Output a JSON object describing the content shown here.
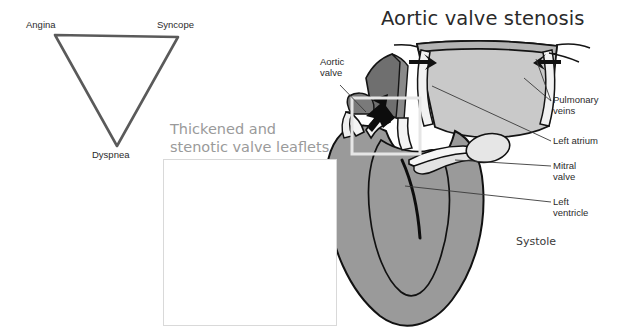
{
  "figure": {
    "title": "Aortic valve stenosis",
    "background_color": "#ffffff",
    "phase_label": "Systole"
  },
  "symptom_triad": {
    "shape": "inverted-triangle",
    "stroke_color": "#5a5a5a",
    "vertices": [
      {
        "label": "Angina",
        "x": 55,
        "y": 35
      },
      {
        "label": "Syncope",
        "x": 178,
        "y": 37
      },
      {
        "label": "Dyspnea",
        "x": 117,
        "y": 146
      }
    ]
  },
  "inset": {
    "caption_line1": "Thickened and",
    "caption_line2": "stenotic valve leaflets",
    "caption_color": "#9a9a9a",
    "border_color": "#d9d9d9",
    "illustration": "aortic-valve-short-axis-stenotic-leaflets"
  },
  "heart": {
    "structure_colors": {
      "myocardium": "#9a9a9a",
      "chamber_light": "#c9c9c9",
      "aorta_shadow": "#6f6f6f",
      "valve_white": "#f4f4f4",
      "outline": "#1a1a1a"
    },
    "callouts": [
      {
        "name": "aortic-valve",
        "line1": "Aortic",
        "line2": "valve"
      },
      {
        "name": "pulmonary-veins",
        "line1": "Pulmonary",
        "line2": "veins"
      },
      {
        "name": "left-atrium",
        "line1": "Left atrium",
        "line2": ""
      },
      {
        "name": "mitral-valve",
        "line1": "Mitral",
        "line2": "valve"
      },
      {
        "name": "left-ventricle",
        "line1": "Left",
        "line2": "ventricle"
      }
    ],
    "highlight_box": {
      "name": "aortic-valve-zoom-region",
      "color": "#e8e8e8"
    },
    "flow_arrows": [
      "aortic-outflow-jet",
      "pulmonary-vein-inflow-left",
      "pulmonary-vein-inflow-right"
    ]
  }
}
